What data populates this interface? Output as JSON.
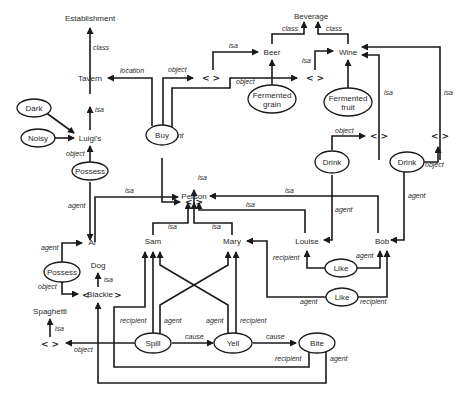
{
  "diagram": {
    "type": "semantic-network",
    "concepts": {
      "establishment": "Establishment",
      "beverage": "Beverage",
      "beer": "Beer",
      "wine": "Wine",
      "tavern": "Tavern",
      "luigis": "Luigi's",
      "person": "Person",
      "al": "Al",
      "sam": "Sam",
      "mary": "Mary",
      "louise": "Louise",
      "bob": "Bob",
      "dog": "Dog",
      "blackie": "Blackie",
      "spaghetti": "Spaghetti"
    },
    "events": {
      "dark": "Dark",
      "noisy": "Noisy",
      "possess1": "Possess",
      "possess2": "Possess",
      "buy": "Buy",
      "fermented_grain_1": "Fermented",
      "fermented_grain_2": "grain",
      "fermented_fruit_1": "Fermented",
      "fermented_fruit_2": "fruit",
      "drink1": "Drink",
      "drink2": "Drink",
      "like1": "Like",
      "like2": "Like",
      "spill": "Spill",
      "yell": "Yell",
      "bite": "Bite"
    },
    "variable_marker": "<  >",
    "edge_labels": {
      "class": "class",
      "isa": "isa",
      "location": "location",
      "object": "object",
      "agent": "agent",
      "recipient": "recipient",
      "cause": "cause"
    },
    "edges": [
      {
        "from": "Tavern",
        "to": "Establishment",
        "label": "class"
      },
      {
        "from": "Luigi's",
        "to": "Tavern",
        "label": "isa"
      },
      {
        "from": "Buy",
        "to": "Tavern",
        "label": "location"
      },
      {
        "from": "Dark",
        "to": "Luigi's",
        "label": ""
      },
      {
        "from": "Noisy",
        "to": "Luigi's",
        "label": ""
      },
      {
        "from": "Possess",
        "to": "Luigi's",
        "label": "object"
      },
      {
        "from": "Possess",
        "to": "Al",
        "label": "agent"
      },
      {
        "from": "Buy",
        "to": "<beer var>",
        "label": "object"
      },
      {
        "from": "Buy",
        "to": "<wine var>",
        "label": "object"
      },
      {
        "from": "Buy",
        "to": "<person var>",
        "label": "agent"
      },
      {
        "from": "<beer var>",
        "to": "Beer",
        "label": "isa"
      },
      {
        "from": "<wine var>",
        "to": "Wine",
        "label": "isa"
      },
      {
        "from": "Beer",
        "to": "Beverage",
        "label": "class"
      },
      {
        "from": "Wine",
        "to": "Beverage",
        "label": "class"
      },
      {
        "from": "Fermented grain",
        "to": "Beer",
        "label": ""
      },
      {
        "from": "Fermented fruit",
        "to": "Wine",
        "label": ""
      },
      {
        "from": "<drink var 1>",
        "to": "Wine",
        "label": "isa"
      },
      {
        "from": "<drink var 2>",
        "to": "Wine",
        "label": "isa"
      },
      {
        "from": "Drink",
        "to": "<drink var 1>",
        "label": "object"
      },
      {
        "from": "Drink",
        "to": "Louise",
        "label": "agent"
      },
      {
        "from": "Drink",
        "to": "<drink var 2>",
        "label": "object"
      },
      {
        "from": "Drink",
        "to": "Bob",
        "label": "agent"
      },
      {
        "from": "<person var>",
        "to": "Person",
        "label": "isa"
      },
      {
        "from": "Al",
        "to": "Person",
        "label": "isa"
      },
      {
        "from": "Bob",
        "to": "Person",
        "label": "isa"
      },
      {
        "from": "Louise",
        "to": "Person",
        "label": "isa"
      },
      {
        "from": "Sam",
        "to": "Person",
        "label": "isa"
      },
      {
        "from": "Mary",
        "to": "Person",
        "label": "isa"
      },
      {
        "from": "Possess",
        "to": "Al",
        "label": "agent"
      },
      {
        "from": "Possess",
        "to": "Blackie",
        "label": "object"
      },
      {
        "from": "Blackie",
        "to": "Dog",
        "label": "isa"
      },
      {
        "from": "<spaghetti var>",
        "to": "Spaghetti",
        "label": "isa"
      },
      {
        "from": "Like",
        "to": "Louise",
        "label": "recipient"
      },
      {
        "from": "Like",
        "to": "Bob",
        "label": "agent"
      },
      {
        "from": "Like",
        "to": "Mary",
        "label": "agent"
      },
      {
        "from": "Like",
        "to": "Bob",
        "label": "recipient"
      },
      {
        "from": "Spill",
        "to": "<spaghetti var>",
        "label": "object"
      },
      {
        "from": "Spill",
        "to": "Sam",
        "label": "recipient"
      },
      {
        "from": "Spill",
        "to": "Mary",
        "label": "agent"
      },
      {
        "from": "Spill",
        "to": "Yell",
        "label": "cause"
      },
      {
        "from": "Yell",
        "to": "Sam",
        "label": "agent"
      },
      {
        "from": "Yell",
        "to": "Mary",
        "label": "recipient"
      },
      {
        "from": "Yell",
        "to": "Bite",
        "label": "cause"
      },
      {
        "from": "Bite",
        "to": "Sam",
        "label": "recipient"
      },
      {
        "from": "Bite",
        "to": "Blackie",
        "label": "agent"
      }
    ]
  }
}
